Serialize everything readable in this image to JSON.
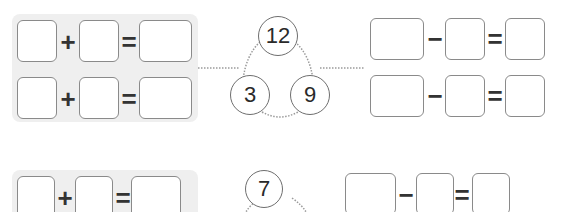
{
  "problems": [
    {
      "whole": "12",
      "parts": [
        "3",
        "9"
      ],
      "addition": {
        "operator": "+",
        "equals": "="
      },
      "subtraction": {
        "operator": "−",
        "equals": "="
      }
    },
    {
      "whole": "7",
      "parts": [
        "",
        ""
      ],
      "addition": {
        "operator": "+",
        "equals": "="
      },
      "subtraction": {
        "operator": "−",
        "equals": "="
      }
    }
  ],
  "colors": {
    "panel": "#efefef",
    "box_border": "#8a8a8a",
    "circle_border": "#6e6e6e",
    "dots": "#9a9a9a"
  }
}
